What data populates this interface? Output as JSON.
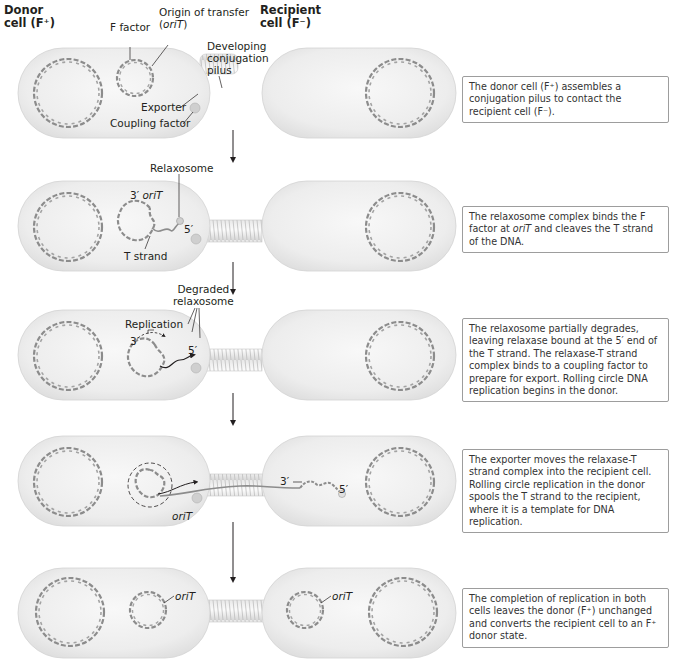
{
  "header": {
    "donor_label_line1": "Donor",
    "donor_label_line2": "cell (F⁺)",
    "recipient_label_line1": "Recipient",
    "recipient_label_line2": "cell (F⁻)"
  },
  "panel1": {
    "labels": {
      "f_factor": "F factor",
      "origin_line1": "Origin of transfer",
      "origin_line2_open": "(",
      "origin_line2_italic": "oriT",
      "origin_line2_close": ")",
      "pilus_line1": "Developing",
      "pilus_line2": "conjugation",
      "pilus_line3": "pilus",
      "exporter": "Exporter",
      "coupling_factor": "Coupling factor"
    },
    "caption": "The donor cell (F⁺) assembles a conjugation pilus to contact the recipient cell (F⁻)."
  },
  "panel2": {
    "labels": {
      "relaxosome": "Relaxosome",
      "three_prime": "3′",
      "oriT": "oriT",
      "five_prime": "5′",
      "t_strand": "T strand"
    },
    "caption_part1": "The relaxosome complex binds the F factor at ",
    "caption_italic": "oriT",
    "caption_part2": " and cleaves the T strand of the DNA."
  },
  "panel3": {
    "labels": {
      "degraded_line1": "Degraded",
      "degraded_line2": "relaxosome",
      "replication": "Replication",
      "three_prime": "3′",
      "five_prime": "5′"
    },
    "caption": "The relaxosome partially degrades, leaving relaxase bound at the 5′ end of the T strand. The relaxase-T strand complex binds to a coupling factor to prepare for export. Rolling circle DNA replication begins in the donor."
  },
  "panel4": {
    "labels": {
      "oriT": "oriT",
      "three_prime": "3′",
      "five_prime": "5′"
    },
    "caption": "The exporter moves the relaxase-T strand complex into the recipient cell. Rolling circle replication in the donor spools the T strand to the recipient, where it is a template for DNA replication."
  },
  "panel5": {
    "labels": {
      "donor_oriT": "oriT",
      "recipient_oriT": "oriT"
    },
    "caption": "The completion of replication in both cells leaves the donor (F⁺) unchanged and converts the recipient cell to an F⁺ donor state."
  },
  "colors": {
    "cell_fill": "#efefef",
    "cell_edge": "#d6d6d6",
    "dna": "#8c8c8c",
    "text": "#231f20",
    "caption_border": "#9d9d9d"
  }
}
